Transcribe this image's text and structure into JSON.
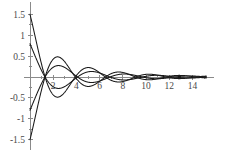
{
  "chart_data": {
    "type": "line",
    "title": "",
    "subtitle": "",
    "xlabel": "",
    "ylabel": "",
    "xlim": [
      0,
      15.2
    ],
    "ylim": [
      -1.55,
      1.55
    ],
    "grid": false,
    "legend": null,
    "background_color": "#ffffff",
    "curve_color": "#1a1a1a",
    "axis_color": "#8a8a8a",
    "label_color": "#4a4a4a",
    "x_ticks": [
      2,
      4,
      6,
      8,
      10,
      12,
      14
    ],
    "x_tick_labels": [
      "2",
      "4",
      "6",
      "8",
      "10",
      "12",
      "14"
    ],
    "x_minor_ticks": [
      1,
      3,
      5,
      7,
      9,
      11,
      13,
      15
    ],
    "y_ticks": [
      1.5,
      1.0,
      0.5,
      -0.5,
      -1.0,
      -1.5
    ],
    "y_tick_labels": [
      "1.5",
      "1",
      "0.5",
      "-0.5",
      "-1",
      "-1.5"
    ],
    "y_minor_ticks": [
      1.25,
      0.75,
      0.25,
      -0.25,
      -0.75,
      -1.25
    ],
    "series": [
      {
        "name": "curve-1",
        "description": "largest amplitude damped oscillation, peak ~1.5 near x=2.1",
        "amplitude": 1.5,
        "period": 5.2,
        "phase": 0.0,
        "decay": 0.165,
        "envelope_power": 0.58
      },
      {
        "name": "curve-2",
        "description": "second damped oscillation, peak ~0.78 near x=2.2",
        "amplitude": 0.8,
        "period": 5.6,
        "phase": 0.12,
        "decay": 0.145,
        "envelope_power": 0.55
      },
      {
        "name": "curve-3",
        "description": "inverted phase damped oscillation, trough ~-0.78 near x=2.3",
        "amplitude": 0.8,
        "period": 5.6,
        "phase": 3.2617993877991496,
        "decay": 0.145,
        "envelope_power": 0.55
      },
      {
        "name": "curve-4",
        "description": "inverted phase large damped oscillation, trough ~-1.5 near x=2.1",
        "amplitude": 1.5,
        "period": 5.2,
        "phase": 3.141592653589793,
        "decay": 0.165,
        "envelope_power": 0.58
      }
    ]
  }
}
